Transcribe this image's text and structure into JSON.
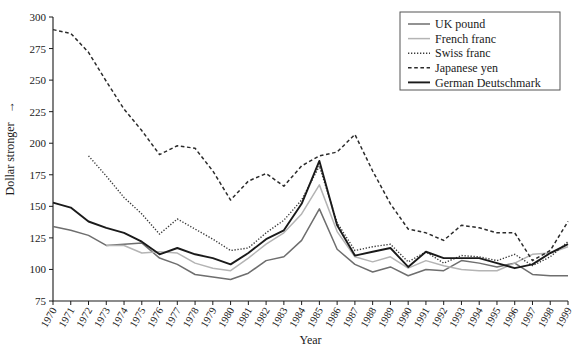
{
  "chart_data": {
    "type": "line",
    "title": "",
    "xlabel": "Year",
    "ylabel": "Dollar stronger  →",
    "ylim": [
      75,
      300
    ],
    "xlim": [
      1970,
      1999
    ],
    "yticks": [
      75,
      100,
      125,
      150,
      175,
      200,
      225,
      250,
      275,
      300
    ],
    "ytick_labels": [
      "75",
      "100",
      "125",
      "150",
      "175",
      "200",
      "225",
      "250",
      "275",
      "300"
    ],
    "grid": false,
    "legend_position": "top-right",
    "x": [
      1970,
      1971,
      1972,
      1973,
      1974,
      1975,
      1976,
      1977,
      1978,
      1979,
      1980,
      1981,
      1982,
      1983,
      1984,
      1985,
      1986,
      1987,
      1988,
      1989,
      1990,
      1991,
      1992,
      1993,
      1994,
      1995,
      1996,
      1997,
      1998,
      1999
    ],
    "categories": [
      "1970",
      "1971",
      "1972",
      "1973",
      "1974",
      "1975",
      "1976",
      "1977",
      "1978",
      "1979",
      "1980",
      "1981",
      "1982",
      "1983",
      "1984",
      "1985",
      "1986",
      "1987",
      "1988",
      "1989",
      "1990",
      "1991",
      "1992",
      "1993",
      "1994",
      "1995",
      "1996",
      "1997",
      "1998",
      "1999"
    ],
    "series": [
      {
        "name": "UK pound",
        "color": "#6e6e6e",
        "style": "solid",
        "width": 1.5,
        "values": [
          134,
          131,
          127,
          119,
          120,
          121,
          109,
          104,
          96,
          94,
          92,
          97,
          107,
          110,
          123,
          148,
          116,
          104,
          98,
          102,
          95,
          100,
          99,
          107,
          105,
          102,
          105,
          96,
          95,
          95
        ]
      },
      {
        "name": "French franc",
        "color": "#b4b4b4",
        "style": "solid",
        "width": 1.5,
        "values": [
          null,
          null,
          null,
          119,
          119,
          113,
          114,
          113,
          105,
          101,
          99,
          109,
          120,
          129,
          144,
          167,
          130,
          110,
          106,
          110,
          101,
          107,
          103,
          100,
          99,
          99,
          105,
          112,
          113,
          118
        ]
      },
      {
        "name": "Swiss franc",
        "color": "#3a3a3a",
        "style": "dotted",
        "width": 1.4,
        "values": [
          null,
          null,
          190,
          174,
          157,
          144,
          128,
          140,
          132,
          124,
          115,
          117,
          129,
          139,
          155,
          182,
          137,
          115,
          118,
          120,
          106,
          114,
          105,
          111,
          110,
          107,
          112,
          103,
          110,
          122
        ]
      },
      {
        "name": "Japanese yen",
        "color": "#2b2b2b",
        "style": "dashed",
        "width": 1.5,
        "values": [
          290,
          287,
          272,
          249,
          227,
          210,
          191,
          198,
          196,
          178,
          155,
          170,
          176,
          166,
          182,
          190,
          193,
          207,
          178,
          152,
          132,
          129,
          123,
          135,
          133,
          129,
          129,
          107,
          115,
          138
        ]
      },
      {
        "name": "German Deutschmark",
        "color": "#1a1a1a",
        "style": "solid",
        "width": 1.9,
        "values": [
          153,
          149,
          138,
          133,
          129,
          122,
          112,
          117,
          112,
          109,
          104,
          113,
          124,
          131,
          152,
          186,
          135,
          111,
          114,
          117,
          102,
          114,
          109,
          109,
          109,
          105,
          101,
          104,
          113,
          120
        ]
      }
    ]
  },
  "legend": {
    "items": [
      {
        "label": "UK pound"
      },
      {
        "label": "French franc"
      },
      {
        "label": "Swiss franc"
      },
      {
        "label": "Japanese yen"
      },
      {
        "label": "German Deutschmark"
      }
    ]
  },
  "axes": {
    "y_title": "Dollar stronger",
    "y_arrow": "→",
    "x_title": "Year"
  }
}
